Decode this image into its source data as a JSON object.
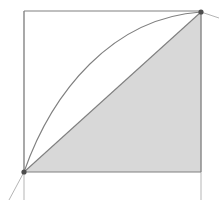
{
  "figure": {
    "width": 222,
    "height": 213,
    "background_color": "#ffffff"
  },
  "colors": {
    "stroke": "#808080",
    "stroke_light": "#b5b5b5",
    "fill_shaded": "#d8d8d8",
    "point_marker": "#4d4d4d",
    "background": "#ffffff"
  },
  "geometry": {
    "square": {
      "name": "bounding-square",
      "left": 24,
      "top": 11,
      "right": 201,
      "bottom": 172,
      "stroke_width": 1.1
    },
    "points": [
      {
        "label": "origin-point",
        "x": 24,
        "y": 172,
        "radius": 2.6
      },
      {
        "label": "upper-point",
        "x": 201,
        "y": 12,
        "radius": 2.6
      }
    ],
    "secant_line": {
      "name": "secant-chord",
      "x1": 24,
      "y1": 172,
      "x2": 201,
      "y2": 12,
      "extend_x1": 9,
      "extend_y1": 200,
      "stroke_width": 1.1
    },
    "tangent_segment": {
      "name": "tangent-at-upper-point",
      "x1": 201,
      "y1": 12,
      "x2": 219,
      "y2": 18,
      "stroke_width": 1.0
    },
    "curve": {
      "name": "concave-curve",
      "start_x": 24,
      "start_y": 172,
      "end_x": 201,
      "end_y": 12,
      "control1_x": 52,
      "control1_y": 92,
      "control2_x": 112,
      "control2_y": 18,
      "stroke_width": 1.1
    },
    "shaded_region": {
      "name": "shaded-triangle",
      "vertices": "24,172 201,12 201,172",
      "fill": "#d8d8d8"
    },
    "vertical_extensions": [
      {
        "label": "left-axis-extension",
        "x": 24,
        "y1": 11,
        "y2": 200
      },
      {
        "label": "right-axis-extension",
        "x": 201,
        "y1": 11,
        "y2": 200
      }
    ]
  },
  "chart_data": {
    "type": "line",
    "title": "",
    "xlabel": "",
    "ylabel": "",
    "xlim": [
      0,
      1
    ],
    "ylim": [
      0,
      1
    ],
    "grid": false,
    "legend": "none",
    "series": [
      {
        "name": "concave-curve",
        "description": "Concave increasing curve from lower-left corner to upper-right corner",
        "x": [
          0.0,
          0.1,
          0.2,
          0.3,
          0.4,
          0.5,
          0.6,
          0.7,
          0.8,
          0.9,
          1.0
        ],
        "y": [
          0.0,
          0.32,
          0.49,
          0.61,
          0.72,
          0.8,
          0.86,
          0.91,
          0.95,
          0.98,
          1.0
        ]
      },
      {
        "name": "secant-chord",
        "description": "Straight chord joining the two marked endpoints",
        "x": [
          0.0,
          1.0
        ],
        "y": [
          0.0,
          1.0
        ]
      }
    ],
    "annotations": [
      {
        "name": "origin-point",
        "x": 0.0,
        "y": 0.0,
        "marker": "dot"
      },
      {
        "name": "upper-point",
        "x": 1.0,
        "y": 1.0,
        "marker": "dot"
      },
      {
        "name": "shaded-triangle",
        "vertices": [
          [
            0,
            0
          ],
          [
            1,
            1
          ],
          [
            1,
            0
          ]
        ],
        "fill": "#d8d8d8"
      }
    ]
  }
}
